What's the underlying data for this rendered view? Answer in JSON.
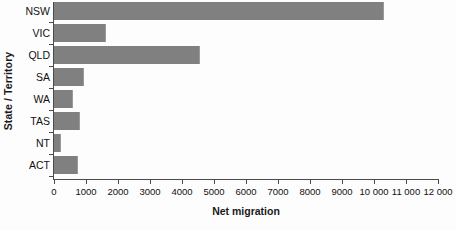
{
  "chart_data": {
    "type": "bar",
    "orientation": "horizontal",
    "title": "",
    "xlabel": "Net migration",
    "ylabel": "State / Territory",
    "categories": [
      "NSW",
      "VIC",
      "QLD",
      "SA",
      "WA",
      "TAS",
      "NT",
      "ACT"
    ],
    "values": [
      10300,
      1620,
      4560,
      930,
      600,
      820,
      220,
      760
    ],
    "xlim": [
      0,
      12000
    ],
    "xticks": [
      0,
      1000,
      2000,
      3000,
      4000,
      5000,
      6000,
      7000,
      8000,
      9000,
      10000,
      11000,
      12000
    ],
    "xtick_labels": [
      "0",
      "1000",
      "2000",
      "3000",
      "4000",
      "5000",
      "6000",
      "7000",
      "8000",
      "9000",
      "10 000",
      "11 000",
      "12 000"
    ],
    "grid": false,
    "legend": null,
    "bar_color": "#808080",
    "axis_color": "#4a4a4a",
    "background_color": "#fdfdfd"
  }
}
